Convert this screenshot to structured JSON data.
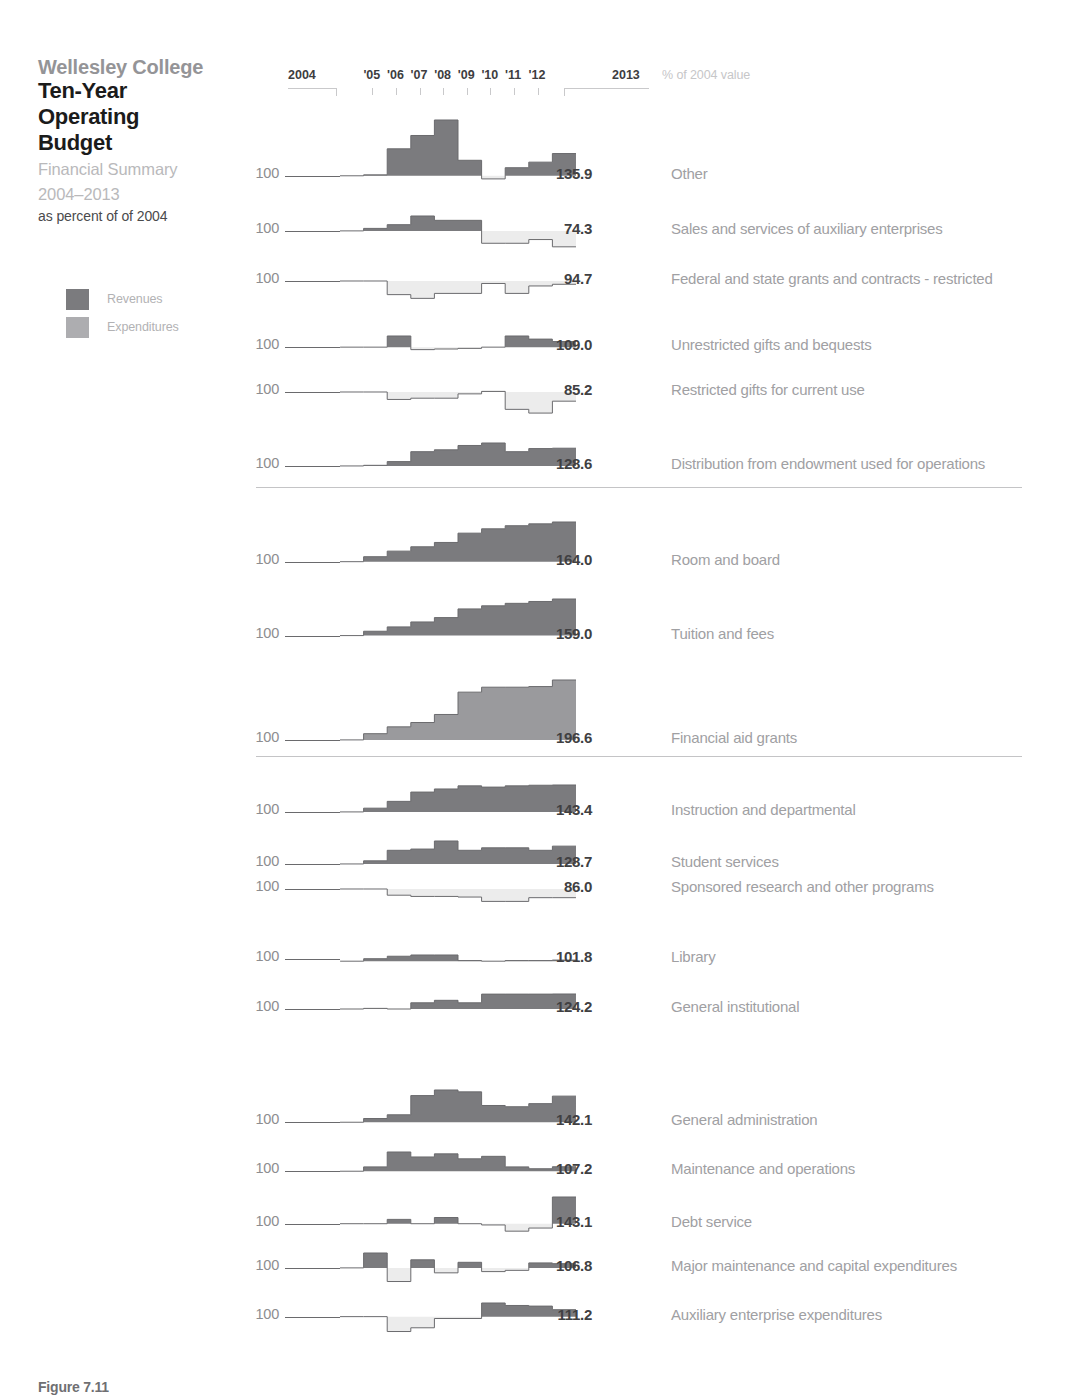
{
  "header": {
    "org": "Wellesley College",
    "title_line1": "Ten-Year",
    "title_line2": "Operating",
    "title_line3": "Budget",
    "subtitle_line1": "Financial Summary",
    "subtitle_line2": "2004–2013",
    "subtitle_line3": "as percent of of 2004"
  },
  "legend": {
    "items": [
      {
        "label": "Revenues",
        "color": "#7b7b7e"
      },
      {
        "label": "Expenditures",
        "color": "#adadb0"
      }
    ]
  },
  "colors": {
    "revenue_fill": "#7b7b7e",
    "expenditure_fill": "#ececec",
    "expenditure_swatch": "#adadb0",
    "financial_aid_fill": "#9a9a9d",
    "line": "#6a6a6d",
    "baseline": "#6a6a6d",
    "separator": "#c4c4c6",
    "value_text": "#404042",
    "label_text": "#a0a0a3"
  },
  "axis": {
    "start_label": "2004",
    "end_label": "2013",
    "tick_labels": [
      "'05",
      "'06",
      "'07",
      "'08",
      "'09",
      "'10",
      "'11",
      "'12"
    ],
    "note": "% of 2004 value",
    "baseline_label": "100"
  },
  "caption": {
    "figure": "Figure 7.11",
    "text": "Office of ... Operating ..."
  },
  "chart_data": {
    "type": "line",
    "title": "Wellesley College Ten-Year Operating Budget",
    "subtitle": "Financial Summary 2004–2013, as percent of of 2004",
    "xlabel": "",
    "ylabel": "% of 2004 value",
    "x": [
      2004,
      2005,
      2006,
      2007,
      2008,
      2009,
      2010,
      2011,
      2012,
      2013
    ],
    "baseline": 100,
    "note": "Each small multiple is a step-area sparkline indexed to 2004 = 100. Area above 100 filled dark (revenues) or mid-gray; area below 100 filled very light gray. The bold number at right is the 2013 value.",
    "groups": [
      {
        "name": "Revenues – other sources",
        "series": [
          {
            "name": "Other",
            "final_value": 135.9,
            "kind": "revenue",
            "values": [
              100.0,
              101.5,
              143.5,
              165.0,
              190.0,
              190.0,
              125.0,
              95.0,
              113.0,
              122.0,
              135.9
            ]
          },
          {
            "name": "Sales and services of auxiliary enterprises",
            "final_value": 74.3,
            "kind": "revenue",
            "values": [
              100.0,
              104.0,
              110.0,
              110.0,
              124.0,
              117.0,
              117.0,
              80.0,
              84.0,
              80.0,
              86.0,
              74.3
            ]
          },
          {
            "name": "Federal and state grants and contracts - restricted",
            "final_value": 94.7,
            "kind": "revenue",
            "values": [
              100.0,
              100.0,
              78.0,
              72.0,
              80.0,
              80.0,
              80.0,
              96.0,
              80.0,
              92.0,
              94.7
            ]
          },
          {
            "name": "Unrestricted gifts and bequests",
            "final_value": 109.0,
            "kind": "revenue",
            "values": [
              100.0,
              100.0,
              118.0,
              93.0,
              96.0,
              97.0,
              98.0,
              100.0,
              101.0,
              118.0,
              113.0,
              109.0
            ]
          },
          {
            "name": "Restricted gifts for current use",
            "final_value": 85.2,
            "kind": "revenue",
            "values": [
              100.0,
              100.0,
              88.0,
              82.0,
              90.0,
              90.0,
              97.0,
              101.0,
              90.0,
              72.0,
              66.0,
              85.2
            ]
          },
          {
            "name": "Distribution from endowment used for operations",
            "final_value": 128.6,
            "kind": "revenue",
            "values": [
              100.0,
              101.0,
              107.0,
              114.0,
              123.0,
              126.0,
              133.0,
              137.0,
              124.0,
              123.0,
              128.0,
              128.6
            ]
          }
        ]
      },
      {
        "name": "Revenues – student charges / aid",
        "series": [
          {
            "name": "Room and board",
            "final_value": 164.0,
            "kind": "revenue",
            "values": [
              100.0,
              108.0,
              117.0,
              124.0,
              131.0,
              138.0,
              146.0,
              153.0,
              158.0,
              161.0,
              164.0
            ]
          },
          {
            "name": "Tuition and fees",
            "final_value": 159.0,
            "kind": "revenue",
            "values": [
              100.0,
              107.0,
              114.0,
              122.0,
              129.0,
              136.0,
              143.0,
              148.0,
              152.0,
              155.0,
              159.0
            ]
          },
          {
            "name": "Financial aid grants",
            "final_value": 196.6,
            "kind": "financial_aid",
            "values": [
              100.0,
              110.0,
              121.0,
              128.0,
              141.0,
              157.0,
              177.0,
              185.0,
              185.0,
              186.0,
              196.6
            ]
          }
        ]
      },
      {
        "name": "Expenditures",
        "series": [
          {
            "name": "Instruction and departmental",
            "final_value": 143.4,
            "kind": "revenue",
            "values": [
              100.0,
              106.0,
              117.0,
              132.0,
              137.0,
              140.0,
              142.0,
              140.0,
              142.0,
              143.0,
              143.4
            ]
          },
          {
            "name": "Student services",
            "final_value": 128.7,
            "kind": "revenue",
            "values": [
              100.0,
              105.0,
              122.0,
              124.0,
              137.0,
              124.0,
              122.0,
              126.0,
              126.0,
              122.0,
              128.7
            ]
          },
          {
            "name": "Sponsored research and other programs",
            "final_value": 86.0,
            "kind": "expenditure",
            "values": [
              100.0,
              100.0,
              90.0,
              88.0,
              88.0,
              87.0,
              87.0,
              80.0,
              80.0,
              86.0,
              86.0
            ]
          },
          {
            "name": "Library",
            "final_value": 101.8,
            "kind": "revenue",
            "values": [
              100.0,
              104.0,
              108.0,
              110.0,
              110.0,
              116.0,
              101.0,
              100.0,
              101.0,
              101.0,
              101.8
            ]
          },
          {
            "name": "General institutional",
            "final_value": 124.2,
            "kind": "revenue",
            "values": [
              100.0,
              101.0,
              100.0,
              110.0,
              114.0,
              116.0,
              110.0,
              124.0,
              124.0,
              124.0,
              124.2
            ]
          },
          {
            "name": "General administration",
            "final_value": 142.1,
            "kind": "revenue",
            "values": [
              100.0,
              106.0,
              112.0,
              143.0,
              152.0,
              176.0,
              149.0,
              127.0,
              125.0,
              130.0,
              142.1
            ]
          },
          {
            "name": "Maintenance and operations",
            "final_value": 107.2,
            "kind": "revenue",
            "values": [
              100.0,
              107.0,
              131.0,
              123.0,
              128.0,
              130.0,
              120.0,
              124.0,
              107.0,
              104.0,
              107.2
            ]
          },
          {
            "name": "Debt service",
            "final_value": 143.1,
            "kind": "revenue",
            "values": [
              100.0,
              100.0,
              107.0,
              100.0,
              110.0,
              100.0,
              100.0,
              98.0,
              88.0,
              93.0,
              143.1
            ]
          },
          {
            "name": "Major maintenance and capital expenditures",
            "final_value": 106.8,
            "kind": "revenue",
            "values": [
              100.0,
              124.0,
              78.0,
              113.0,
              92.0,
              86.0,
              109.0,
              94.0,
              96.0,
              108.0,
              106.8
            ]
          },
          {
            "name": "Auxiliary enterprise expenditures",
            "final_value": 111.2,
            "kind": "revenue",
            "values": [
              100.0,
              100.0,
              76.0,
              82.0,
              97.0,
              97.0,
              122.0,
              118.0,
              117.0,
              111.2
            ]
          }
        ]
      }
    ]
  },
  "layout": {
    "rows": [
      {
        "series": "Other",
        "baseline_y": 176,
        "group": 0
      },
      {
        "series": "Sales and services of auxiliary enterprises",
        "baseline_y": 231,
        "group": 0
      },
      {
        "series": "Federal and state grants and contracts - restricted",
        "baseline_y": 281,
        "group": 0
      },
      {
        "series": "Unrestricted gifts and bequests",
        "baseline_y": 347,
        "group": 0
      },
      {
        "series": "Restricted gifts for current use",
        "baseline_y": 392,
        "group": 0
      },
      {
        "series": "Distribution from endowment used for operations",
        "baseline_y": 466,
        "group": 0
      },
      {
        "series": "Room and board",
        "baseline_y": 562,
        "group": 1
      },
      {
        "series": "Tuition and fees",
        "baseline_y": 636,
        "group": 1
      },
      {
        "series": "Financial aid grants",
        "baseline_y": 740,
        "group": 1
      },
      {
        "series": "Instruction and departmental",
        "baseline_y": 812,
        "group": 2
      },
      {
        "series": "Student services",
        "baseline_y": 864,
        "group": 2
      },
      {
        "series": "Sponsored research and other programs",
        "baseline_y": 889,
        "group": 2
      },
      {
        "series": "Library",
        "baseline_y": 959,
        "group": 2
      },
      {
        "series": "General institutional",
        "baseline_y": 1009,
        "group": 2
      },
      {
        "series": "General administration",
        "baseline_y": 1122,
        "group": 2
      },
      {
        "series": "Maintenance and operations",
        "baseline_y": 1171,
        "group": 2
      },
      {
        "series": "Debt service",
        "baseline_y": 1224,
        "group": 2
      },
      {
        "series": "Major maintenance and capital expenditures",
        "baseline_y": 1268,
        "group": 2
      },
      {
        "series": "Auxiliary enterprise expenditures",
        "baseline_y": 1317,
        "group": 2
      }
    ],
    "separators_y": [
      487,
      756
    ],
    "spark_x": 340,
    "spark_w": 236,
    "value_x": 592,
    "label_x": 671,
    "hundred_x": 279,
    "scale_px_per_pct": 0.62
  }
}
